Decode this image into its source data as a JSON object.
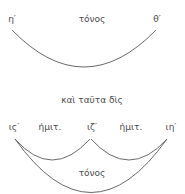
{
  "top_diagram": {
    "left_label": "η′",
    "center_label": "τόνος",
    "right_label": "θ′"
  },
  "middle_caption": "καὶ ταῦτα δὶς",
  "bottom_diagram": {
    "left_label": "ις′",
    "left_interval_label": "ἡμιτ.",
    "middle_label": "ιζ′",
    "right_interval_label": "ἡμιτ.",
    "right_label": "ιη′",
    "span_label": "τόνος"
  },
  "colors": {
    "text": "#4a4a4a",
    "stroke": "#6a6a6a",
    "background": "#ffffff"
  }
}
